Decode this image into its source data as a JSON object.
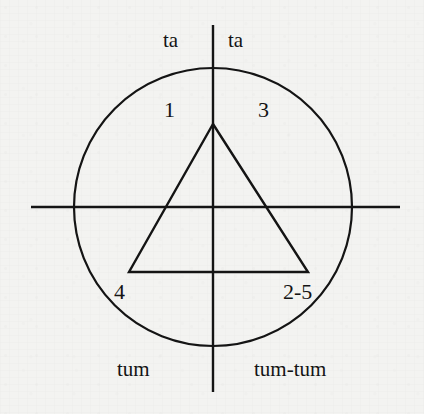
{
  "figure": {
    "background_color": "#f3f3f1",
    "stroke_color": "#141414",
    "width": 424,
    "height": 414,
    "circle": {
      "cx": 213,
      "cy": 207,
      "r": 139,
      "stroke_width": 2.2
    },
    "vertical_axis": {
      "x": 213,
      "y1": 25,
      "y2": 392,
      "stroke_width": 2.4
    },
    "horizontal_axis": {
      "y": 207,
      "x1": 31,
      "x2": 400,
      "stroke_width": 2.4
    },
    "triangle": {
      "apex": {
        "x": 213,
        "y": 124
      },
      "bottom_left": {
        "x": 129,
        "y": 272
      },
      "bottom_right": {
        "x": 308,
        "y": 272
      },
      "stroke_width": 2.4,
      "points": "213,124 308,272 129,272"
    }
  },
  "labels": {
    "top_left": "ta",
    "top_right": "ta",
    "quadrant_upper_left": "1",
    "quadrant_upper_right": "3",
    "quadrant_lower_left": "4",
    "quadrant_lower_right": "2-5",
    "bottom_left": "tum",
    "bottom_right": "tum-tum"
  }
}
